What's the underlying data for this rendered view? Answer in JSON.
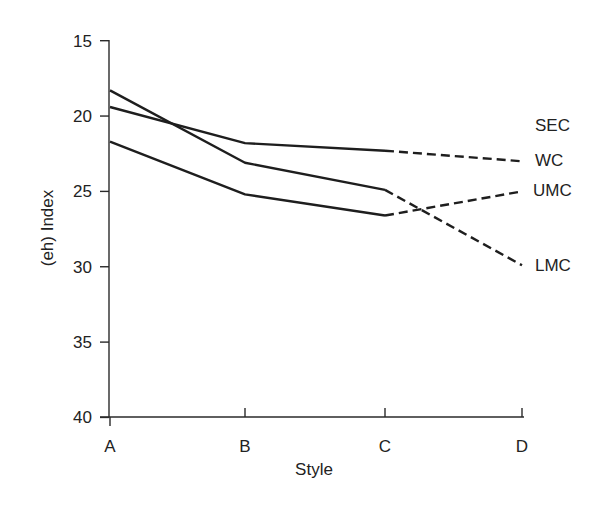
{
  "chart_data": {
    "type": "line",
    "title": "",
    "xlabel": "Style",
    "ylabel": "(eh) Index",
    "categories": [
      "A",
      "B",
      "C",
      "D"
    ],
    "ylim": [
      40,
      15
    ],
    "y_inverted": true,
    "yticks": [
      15,
      20,
      25,
      30,
      35,
      40
    ],
    "grid": false,
    "legend_position": "right, inline end labels",
    "series": [
      {
        "name": "WC",
        "values": [
          19.4,
          21.8,
          22.3,
          23.0
        ],
        "style": "solid A–C, dashed C–D"
      },
      {
        "name": "UMC",
        "values": [
          21.7,
          25.2,
          26.6,
          25.0
        ],
        "style": "solid A–C, dashed C–D"
      },
      {
        "name": "LMC",
        "values": [
          18.3,
          23.1,
          24.9,
          29.9
        ],
        "style": "solid A–C, dashed C–D"
      }
    ],
    "annotations": [
      "SEC"
    ],
    "end_labels": [
      "SEC",
      "WC",
      "UMC",
      "LMC"
    ]
  },
  "axes": {
    "x_title": "Style",
    "y_title": "(eh) Index",
    "x_ticks": [
      "A",
      "B",
      "C",
      "D"
    ],
    "y_ticks": [
      "15",
      "20",
      "25",
      "30",
      "35",
      "40"
    ]
  },
  "labels": {
    "sec": "SEC",
    "wc": "WC",
    "umc": "UMC",
    "lmc": "LMC"
  },
  "colors": {
    "line": "#1e1e1e",
    "axis": "#2a2a2a",
    "text": "#222222",
    "background": "#ffffff"
  }
}
